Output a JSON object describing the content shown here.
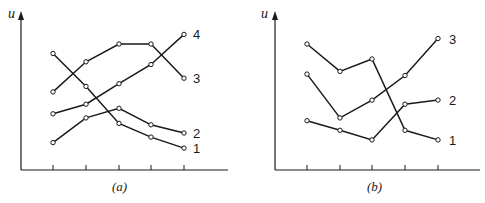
{
  "chart_data": [
    {
      "type": "line",
      "caption": "(a)",
      "ylabel": "u",
      "xlabel": "",
      "x": [
        1,
        2,
        3,
        4,
        5
      ],
      "xticks_labeled": false,
      "ylim": [
        0,
        10
      ],
      "grid": false,
      "series": [
        {
          "name": "1",
          "values": [
            8.5,
            6.1,
            3.4,
            2.4,
            1.6
          ]
        },
        {
          "name": "2",
          "values": [
            2.0,
            3.8,
            4.5,
            3.3,
            2.7
          ]
        },
        {
          "name": "3",
          "values": [
            5.7,
            7.9,
            9.2,
            9.2,
            6.7
          ]
        },
        {
          "name": "4",
          "values": [
            4.1,
            4.8,
            6.3,
            7.7,
            9.9
          ]
        }
      ]
    },
    {
      "type": "line",
      "caption": "(b)",
      "ylabel": "u",
      "xlabel": "",
      "x": [
        1,
        2,
        3,
        4,
        5
      ],
      "xticks_labeled": false,
      "ylim": [
        0,
        10
      ],
      "grid": false,
      "series": [
        {
          "name": "1",
          "values": [
            9.2,
            7.2,
            8.1,
            2.9,
            2.2
          ]
        },
        {
          "name": "2",
          "values": [
            3.6,
            2.9,
            2.2,
            4.8,
            5.1
          ]
        },
        {
          "name": "3",
          "values": [
            7.0,
            3.8,
            5.1,
            6.9,
            9.6
          ]
        }
      ]
    }
  ]
}
